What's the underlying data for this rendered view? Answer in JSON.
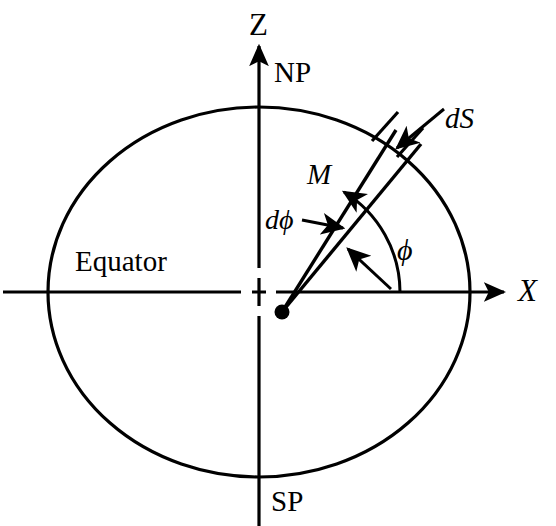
{
  "figure": {
    "background_color": "#ffffff",
    "stroke_color": "#000000"
  },
  "axes": {
    "vertical": {
      "name": "Z",
      "label": "Z",
      "arrow": "up",
      "x": 259,
      "y_top": 42,
      "y_bottom": 526
    },
    "horizontal": {
      "name": "X",
      "label": "X",
      "arrow": "right",
      "y": 292,
      "x_left": 3,
      "x_right": 508
    }
  },
  "labels": {
    "z_axis": "Z",
    "x_axis": "X",
    "north_pole": "NP",
    "south_pole": "SP",
    "equator": "Equator",
    "magnetization": "M",
    "surface_element": "dS",
    "angle_increment": "dϕ",
    "azimuth_angle": "ϕ"
  },
  "sphere": {
    "name": "great-circle-outline",
    "center_x": 259,
    "center_y": 292,
    "radius_x": 211,
    "radius_y": 185,
    "stroke_width": 3.2,
    "fill": "none"
  },
  "origin_marker": {
    "name": "dashed-origin-cross",
    "x": 259,
    "y": 292,
    "dash_half_length": 22
  },
  "source_point": {
    "name": "source-dot",
    "x": 282,
    "y": 312,
    "radius": 7.5,
    "fill": "#000000"
  },
  "wedge": {
    "name": "angular-wedge",
    "apex_x": 282,
    "apex_y": 312,
    "edge_a": {
      "end_x": 396,
      "end_y": 130,
      "label": "M"
    },
    "edge_b": {
      "end_x": 421,
      "end_y": 143
    },
    "tick_a": {
      "x1": 370,
      "y1": 139,
      "x2": 396,
      "y2": 111
    },
    "tick_b": {
      "x1": 396,
      "y1": 155,
      "x2": 420,
      "y2": 128
    }
  },
  "angle_arc": {
    "name": "phi-arc",
    "center_x": 282,
    "center_y": 292,
    "radius": 118,
    "start_deg": 0,
    "end_deg": 58,
    "arrowhead": "at-end"
  },
  "annotation_arrows": [
    {
      "name": "ds-pointer-arrow",
      "from_x": 443,
      "from_y": 110,
      "to_x": 393,
      "to_y": 151
    },
    {
      "name": "dphi-pointer-arrow",
      "from_x": 303,
      "from_y": 221,
      "to_x": 345,
      "to_y": 229
    },
    {
      "name": "wedge-interior-arrow",
      "from_x": 390,
      "from_y": 288,
      "to_x": 346,
      "to_y": 247
    }
  ]
}
